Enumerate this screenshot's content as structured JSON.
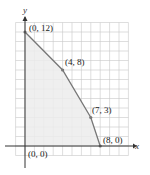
{
  "chart_data": {
    "type": "line",
    "title": "",
    "xlabel": "x",
    "ylabel": "y",
    "xlim": [
      -1,
      11
    ],
    "ylim": [
      -1,
      13
    ],
    "grid": true,
    "shaded_region": true,
    "series": [
      {
        "name": "boundary",
        "points": [
          [
            0,
            12
          ],
          [
            4,
            8
          ],
          [
            7,
            3
          ],
          [
            8,
            0
          ]
        ]
      }
    ],
    "annotations": [
      {
        "label": "(0, 12)",
        "x": 0,
        "y": 12
      },
      {
        "label": "(4, 8)",
        "x": 4,
        "y": 8
      },
      {
        "label": "(7, 3)",
        "x": 7,
        "y": 3
      },
      {
        "label": "(8, 0)",
        "x": 8,
        "y": 0
      },
      {
        "label": "(0, 0)",
        "x": 0,
        "y": 0
      }
    ]
  },
  "labels": {
    "x_axis": "x",
    "y_axis": "y",
    "p0": "(0, 12)",
    "p1": "(4, 8)",
    "p2": "(7, 3)",
    "p3": "(8, 0)",
    "origin": "(0, 0)"
  },
  "colors": {
    "grid": "#c8c8c8",
    "shade": "#ececec",
    "boundary": "#777777",
    "axis": "#333333"
  }
}
